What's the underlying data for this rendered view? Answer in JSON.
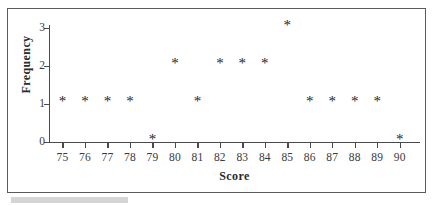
{
  "figure": {
    "caption_placeholder": ""
  },
  "axes": {
    "x_title": "Score",
    "y_title": "Frequency",
    "x_tick_labels": [
      "75",
      "76",
      "77",
      "78",
      "79",
      "80",
      "81",
      "82",
      "83",
      "84",
      "85",
      "86",
      "87",
      "88",
      "89",
      "90"
    ],
    "y_tick_labels": [
      "0",
      "1",
      "2",
      "3"
    ]
  },
  "marker": {
    "glyph": "*",
    "name": "asterisk"
  },
  "colors": {
    "axis": "#4a4a4a",
    "frame": "#5b5b5b",
    "marker": "#262626",
    "text": "#3a3a3a",
    "title": "#2b2b2b",
    "caption_bar": "#d5d5d5",
    "background": "#ffffff"
  },
  "chart_data": {
    "type": "scatter",
    "title": "",
    "subtitle": "",
    "xlabel": "Score",
    "ylabel": "Frequency",
    "xlim": [
      74.4,
      90.9
    ],
    "ylim": [
      0,
      3
    ],
    "xticks": [
      75,
      76,
      77,
      78,
      79,
      80,
      81,
      82,
      83,
      84,
      85,
      86,
      87,
      88,
      89,
      90
    ],
    "yticks": [
      0,
      1,
      2,
      3
    ],
    "grid": false,
    "legend": null,
    "marker_style": "asterisk",
    "x": [
      75,
      76,
      77,
      78,
      79,
      80,
      81,
      82,
      83,
      84,
      85,
      86,
      87,
      88,
      89,
      90
    ],
    "values": [
      1,
      1,
      1,
      1,
      0,
      2,
      1,
      2,
      2,
      2,
      3,
      1,
      1,
      1,
      1,
      0
    ],
    "points": [
      {
        "score": 75,
        "frequency": 1
      },
      {
        "score": 76,
        "frequency": 1
      },
      {
        "score": 77,
        "frequency": 1
      },
      {
        "score": 78,
        "frequency": 1
      },
      {
        "score": 79,
        "frequency": 0
      },
      {
        "score": 80,
        "frequency": 2
      },
      {
        "score": 81,
        "frequency": 1
      },
      {
        "score": 82,
        "frequency": 2
      },
      {
        "score": 83,
        "frequency": 2
      },
      {
        "score": 84,
        "frequency": 2
      },
      {
        "score": 85,
        "frequency": 3
      },
      {
        "score": 86,
        "frequency": 1
      },
      {
        "score": 87,
        "frequency": 1
      },
      {
        "score": 88,
        "frequency": 1
      },
      {
        "score": 89,
        "frequency": 1
      },
      {
        "score": 90,
        "frequency": 0
      }
    ]
  }
}
